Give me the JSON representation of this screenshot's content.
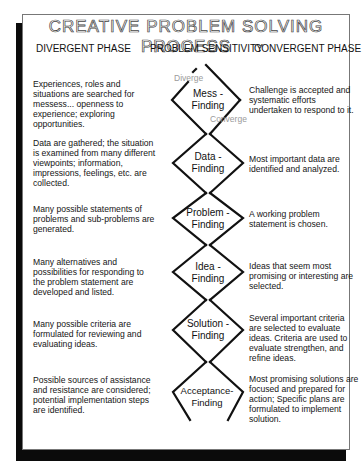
{
  "title": "CREATIVE PROBLEM SOLVING PROCESS",
  "columns": {
    "divergent": "DIVERGENT PHASE",
    "sensitivity": "PROBLEM SENSITIVITY",
    "convergent": "CONVERGENT PHASE"
  },
  "flow_labels": {
    "diverge": "Diverge",
    "converge": "Converge"
  },
  "steps": [
    {
      "name_line1": "Mess -",
      "name_line2": "Finding",
      "divergent": "Experiences, roles and situations are searched for messess... openness to experience; exploring opportunities.",
      "convergent": "Challenge is accepted and systematic efforts undertaken to respond to it."
    },
    {
      "name_line1": "Data -",
      "name_line2": "Finding",
      "divergent": "Data are gathered; the situation is examined from many different viewpoints; information, impressions, feelings, etc. are collected.",
      "convergent": "Most important data are identified and analyzed."
    },
    {
      "name_line1": "Problem -",
      "name_line2": "Finding",
      "divergent": "Many possible statements of problems and sub-problems are generated.",
      "convergent": "A working problem statement is chosen."
    },
    {
      "name_line1": "Idea -",
      "name_line2": "Finding",
      "divergent": "Many alternatives and possibilities for responding to the problem statement are developed and listed.",
      "convergent": "Ideas that seem most promising or interesting are selected."
    },
    {
      "name_line1": "Solution -",
      "name_line2": "Finding",
      "divergent": "Many possible criteria are formulated for reviewing and evaluating ideas.",
      "convergent": "Several important criteria are selected to evaluate ideas. Criteria are used to evaluate strengthen, and refine ideas."
    },
    {
      "name_line1": "Acceptance-",
      "name_line2": "Finding",
      "divergent": "Possible sources of assistance and resistance are considered; potential implementation steps are identified.",
      "convergent": "Most promising solutions are focused and prepared for action; Specific plans are formulated to implement solution."
    }
  ]
}
